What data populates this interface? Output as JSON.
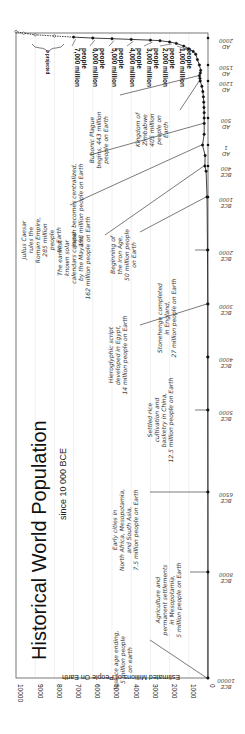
{
  "chart_data": {
    "type": "line",
    "orientation": "rotated-90 (time runs bottom-to-top, population runs right-to-left)",
    "title": "Historical World Population",
    "subtitle": "since 10 000 BCE",
    "ylabel": "Estimated Millions of People On Earth",
    "xlabel": "",
    "ylim": [
      0,
      10000
    ],
    "y_ticks": [
      0,
      1000,
      2000,
      3000,
      4000,
      5000,
      6000,
      7000,
      8000,
      9000,
      10000
    ],
    "x_ticks": [
      {
        "label_top": "10000",
        "label_bottom": "BCE",
        "year": -10000
      },
      {
        "label_top": "8000",
        "label_bottom": "BCE",
        "year": -8000
      },
      {
        "label_top": "6500",
        "label_bottom": "BCE",
        "year": -6500
      },
      {
        "label_top": "5000",
        "label_bottom": "BCE",
        "year": -5000
      },
      {
        "label_top": "4000",
        "label_bottom": "BCE",
        "year": -4000
      },
      {
        "label_top": "3000",
        "label_bottom": "BCE",
        "year": -3000
      },
      {
        "label_top": "2000",
        "label_bottom": "BCE",
        "year": -2000
      },
      {
        "label_top": "1000",
        "label_bottom": "BCE",
        "year": -1000
      },
      {
        "label_top": "400",
        "label_bottom": "BCE",
        "year": -400
      },
      {
        "label_top": "1",
        "label_bottom": "AD",
        "year": 1
      },
      {
        "label_top": "500",
        "label_bottom": "AD",
        "year": 500
      },
      {
        "label_top": "1200",
        "label_bottom": "AD",
        "year": 1200
      },
      {
        "label_top": "1500",
        "label_bottom": "AD",
        "year": 1500
      },
      {
        "label_top": "2000",
        "label_bottom": "AD",
        "year": 2000
      }
    ],
    "grid": true,
    "series": [
      {
        "name": "World population (millions)",
        "points": [
          {
            "year": -10000,
            "value": 5
          },
          {
            "year": -8000,
            "value": 5
          },
          {
            "year": -6500,
            "value": 7.5
          },
          {
            "year": -5000,
            "value": 12.5
          },
          {
            "year": -4000,
            "value": 14
          },
          {
            "year": -3000,
            "value": 14
          },
          {
            "year": -2000,
            "value": 27
          },
          {
            "year": -1000,
            "value": 50
          },
          {
            "year": -500,
            "value": 100
          },
          {
            "year": -400,
            "value": 162
          },
          {
            "year": -200,
            "value": 150
          },
          {
            "year": 1,
            "value": 285
          },
          {
            "year": 200,
            "value": 200
          },
          {
            "year": 400,
            "value": 198
          },
          {
            "year": 500,
            "value": 200
          },
          {
            "year": 600,
            "value": 200
          },
          {
            "year": 700,
            "value": 210
          },
          {
            "year": 800,
            "value": 220
          },
          {
            "year": 900,
            "value": 240
          },
          {
            "year": 1000,
            "value": 270
          },
          {
            "year": 1100,
            "value": 320
          },
          {
            "year": 1200,
            "value": 405
          },
          {
            "year": 1250,
            "value": 420
          },
          {
            "year": 1300,
            "value": 443
          },
          {
            "year": 1350,
            "value": 400
          },
          {
            "year": 1400,
            "value": 380
          },
          {
            "year": 1500,
            "value": 450
          },
          {
            "year": 1600,
            "value": 550
          },
          {
            "year": 1700,
            "value": 640
          },
          {
            "year": 1750,
            "value": 770
          },
          {
            "year": 1800,
            "value": 1000
          },
          {
            "year": 1850,
            "value": 1260
          },
          {
            "year": 1900,
            "value": 1650
          },
          {
            "year": 1927,
            "value": 2000
          },
          {
            "year": 1950,
            "value": 2500
          },
          {
            "year": 1960,
            "value": 3000
          },
          {
            "year": 1974,
            "value": 4000
          },
          {
            "year": 1987,
            "value": 5000
          },
          {
            "year": 1999,
            "value": 6000
          },
          {
            "year": 2011,
            "value": 7000
          }
        ]
      },
      {
        "name": "projected",
        "points": [
          {
            "year": 2025,
            "value": 8000
          },
          {
            "year": 2040,
            "value": 9000
          },
          {
            "year": 2060,
            "value": 9600
          },
          {
            "year": 2080,
            "value": 10000
          }
        ]
      }
    ],
    "legend": {
      "projected_marker": "o projected"
    },
    "annotations": [
      {
        "year": -10000,
        "lines": [
          "last ice age ending,",
          "5 million people",
          "on earth"
        ]
      },
      {
        "year": -8000,
        "lines": [
          "Agriculture and",
          "permanent settlements",
          "in Mesopotamia,",
          "5 million people on Earth"
        ]
      },
      {
        "year": -6500,
        "lines": [
          "Early cities in",
          "North Africa, Mesopotamia,",
          "and South Asia,",
          "7.5 million people on Earth"
        ]
      },
      {
        "year": -5000,
        "lines": [
          "Settled rice",
          "cultivation and",
          "basketry in China,",
          "12.5 million people on Earth"
        ]
      },
      {
        "year": -3000,
        "lines": [
          "Hieroglyphic script",
          "developed in Egypt,",
          "14 million people on Earth"
        ]
      },
      {
        "year": -2000,
        "lines": [
          "Stonehenge completed",
          "in England,",
          "27 million people on Earth"
        ]
      },
      {
        "year": -1000,
        "lines": [
          "Beginning of",
          "the Iron Age,",
          "50 million people",
          "on Earth"
        ]
      },
      {
        "year": -400,
        "lines": [
          "The earliest",
          "known solar",
          "calendars carved",
          "by the Mayans,",
          "162 million people on Earth"
        ]
      },
      {
        "year": 1,
        "lines": [
          "Julius Caesar",
          "rules the",
          "Roman Empire,",
          "285 million",
          "people",
          "on Earth"
        ]
      },
      {
        "year": 400,
        "lines": [
          "Japan becomes centralized,",
          "198 million people on Earth"
        ]
      },
      {
        "year": 1200,
        "lines": [
          "Kingdom of",
          "Zimbabwe",
          "405 million",
          "people on",
          "Earth"
        ]
      },
      {
        "year": 1300,
        "lines": [
          "Bubonic Plague",
          "begins, 443 million",
          "people on Earth"
        ]
      }
    ],
    "milestones": [
      {
        "lines": [
          "1,000 million",
          "people"
        ]
      },
      {
        "lines": [
          "2,000 million",
          "people"
        ]
      },
      {
        "lines": [
          "3,000 million",
          "people"
        ]
      },
      {
        "lines": [
          "4,000 million",
          "people"
        ]
      },
      {
        "lines": [
          "5,000 million",
          "people"
        ]
      },
      {
        "lines": [
          "6,000 million",
          "people"
        ]
      },
      {
        "lines": [
          "7,000 million",
          "people"
        ]
      }
    ]
  },
  "colors": {
    "background": "#ffffff",
    "frame": "#555555",
    "grid": "#e6e6e6",
    "line": "#111111",
    "text": "#222222"
  }
}
